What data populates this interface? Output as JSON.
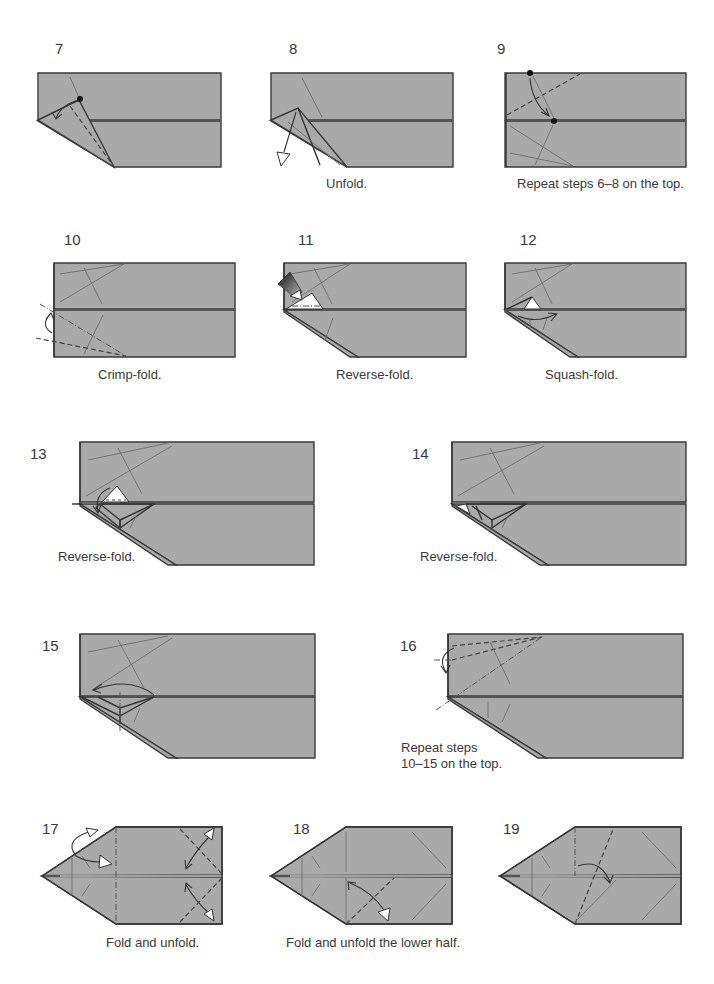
{
  "page": {
    "paper_color": "#a9a9a9",
    "line_color": "#333333",
    "background": "#ffffff"
  },
  "steps": [
    {
      "number": "7",
      "caption": ""
    },
    {
      "number": "8",
      "caption": "Unfold."
    },
    {
      "number": "9",
      "caption": "Repeat steps 6–8 on the top."
    },
    {
      "number": "10",
      "caption": "Crimp-fold."
    },
    {
      "number": "11",
      "caption": "Reverse-fold."
    },
    {
      "number": "12",
      "caption": "Squash-fold."
    },
    {
      "number": "13",
      "caption": "Reverse-fold."
    },
    {
      "number": "14",
      "caption": "Reverse-fold."
    },
    {
      "number": "15",
      "caption": ""
    },
    {
      "number": "16",
      "caption_line1": "Repeat steps",
      "caption_line2": "10–15 on the top."
    },
    {
      "number": "17",
      "caption": "Fold and unfold."
    },
    {
      "number": "18",
      "caption": "Fold and unfold the lower half."
    },
    {
      "number": "19",
      "caption": ""
    }
  ],
  "symbols": {
    "valley_fold": "dashed-line",
    "mountain_fold": "dash-dot-line",
    "push_arrow": "filled-gradient-arrow",
    "fold_arrow": "curved-arrow",
    "unfold_arrow": "hollow-arrowhead",
    "reference_point": "black-dot"
  }
}
